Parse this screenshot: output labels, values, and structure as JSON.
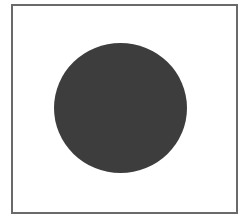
{
  "figure": {
    "frame": {
      "stroke_color": "#6a6a6a",
      "fill_color": "#ffffff"
    },
    "shape": {
      "type": "circle",
      "fill_color": "#3d3d3d",
      "center": [
        120,
        108
      ],
      "radius": 66
    }
  }
}
